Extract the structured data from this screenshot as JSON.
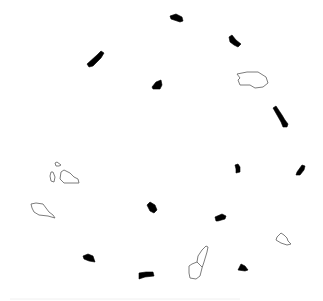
{
  "canvas": {
    "width": 323,
    "height": 301,
    "background": "#ffffff"
  },
  "colors": {
    "filled": "#000000",
    "outline": "#6e6e6e"
  },
  "shapes": [
    {
      "kind": "filled",
      "name": "fragment-top-center",
      "points": "170,16 176,14 182,17 183,21 180,22 171,19"
    },
    {
      "kind": "filled",
      "name": "fragment-top-right",
      "points": "229,37 232,35 236,40 241,44 238,47 234,45 230,42"
    },
    {
      "kind": "filled",
      "name": "fragment-upper-left",
      "points": "87,64 97,55 101,51 104,53 101,58 93,66 89,67"
    },
    {
      "kind": "filled",
      "name": "fragment-upper-mid",
      "points": "152,87 156,82 161,80 162,85 160,89 153,89"
    },
    {
      "kind": "filled",
      "name": "fragment-right-bar",
      "points": "273,108 276,106 282,115 285,120 288,124 287,127 283,127 281,122 277,115"
    },
    {
      "kind": "filled",
      "name": "fragment-mid-right-1",
      "points": "235,165 238,164 240,167 240,172 236,173 236,169"
    },
    {
      "kind": "filled",
      "name": "fragment-far-right",
      "points": "297,172 302,165 305,166 304,170 300,175 296,175"
    },
    {
      "kind": "filled",
      "name": "fragment-center",
      "points": "147,205 150,202 155,205 157,210 154,213 150,211"
    },
    {
      "kind": "filled",
      "name": "fragment-lower-mid",
      "points": "215,217 222,214 226,216 225,219 218,221 216,221"
    },
    {
      "kind": "filled",
      "name": "fragment-lower-left",
      "points": "83,256 88,254 93,256 95,262 89,261 84,259"
    },
    {
      "kind": "filled",
      "name": "fragment-bottom-mid",
      "points": "139,273 146,272 153,272 154,276 145,277 139,279"
    },
    {
      "kind": "filled",
      "name": "fragment-bottom-right",
      "points": "238,270 241,264 245,266 248,270 245,271"
    },
    {
      "kind": "outline",
      "name": "outline-upper-right",
      "points": "237,74 247,72 258,72 266,77 268,83 263,87 255,88 250,85 240,85 238,80 240,78"
    },
    {
      "kind": "outline",
      "name": "outline-left-small",
      "points": "55,163 57,162 61,165 59,166 56,166"
    },
    {
      "kind": "outline",
      "name": "outline-left-sliver",
      "points": "51,172 53,172 55,177 54,182 51,181 50,176"
    },
    {
      "kind": "outline",
      "name": "outline-left-cluster",
      "points": "61,172 64,170 70,173 74,177 78,179 79,183 72,183 64,183 60,179"
    },
    {
      "kind": "outline",
      "name": "outline-left-large",
      "points": "31,204 36,203 43,204 46,208 49,212 53,215 55,218 48,216 39,215 34,212 32,208"
    },
    {
      "kind": "outline",
      "name": "outline-right-small",
      "points": "277,237 281,233 284,235 287,238 288,241 291,244 287,245 281,243 276,240"
    },
    {
      "kind": "outline",
      "name": "outline-bottom-tall",
      "points": "189,266 192,264 197,262 198,256 202,250 206,246 208,247 207,252 204,262 202,268 200,276 196,279 190,278 189,273"
    },
    {
      "kind": "outline",
      "name": "outline-bottom-tall-divider",
      "points": "197,262 202,267"
    }
  ],
  "footer_line": {
    "x1": 10,
    "y1": 299,
    "x2": 240,
    "y2": 299
  }
}
